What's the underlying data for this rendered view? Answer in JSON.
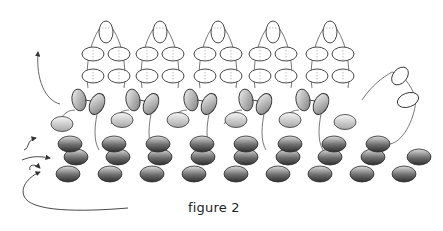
{
  "figure": {
    "caption": "figure 2",
    "colors": {
      "outline": "#333333",
      "thread": "#555555",
      "dashed": "#888888",
      "bead_dark_top": "#d8d8d8",
      "bead_dark_bottom": "#3a3a3a",
      "bead_light_top": "#f4f4f4",
      "bead_light_bottom": "#9a9a9a",
      "arrow": "#333333"
    },
    "base_rows": [
      {
        "name": "row-1",
        "y": 144,
        "xs": [
          70,
          114,
          158,
          202,
          246,
          290,
          334,
          378
        ]
      },
      {
        "name": "row-2",
        "y": 157,
        "xs": [
          76,
          118,
          160,
          203,
          246,
          288,
          330,
          373,
          419
        ]
      },
      {
        "name": "row-3",
        "y": 174,
        "xs": [
          68,
          110,
          152,
          194,
          236,
          278,
          320,
          362,
          404
        ]
      }
    ],
    "mid_light_beads": [
      {
        "x": 62,
        "y": 124
      },
      {
        "x": 122,
        "y": 120
      },
      {
        "x": 178,
        "y": 120
      },
      {
        "x": 236,
        "y": 120
      },
      {
        "x": 290,
        "y": 120
      },
      {
        "x": 345,
        "y": 122
      }
    ],
    "fringe_columns": [
      {
        "x": 106
      },
      {
        "x": 160
      },
      {
        "x": 218
      },
      {
        "x": 273
      },
      {
        "x": 330
      }
    ],
    "top_loop_tail": {
      "x": 392,
      "y": 82
    }
  }
}
